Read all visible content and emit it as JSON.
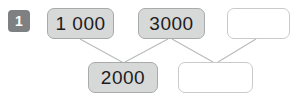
{
  "canvas": {
    "width": 296,
    "height": 98,
    "background": "#ffffff"
  },
  "exercise": {
    "number": "1"
  },
  "colors": {
    "badge_background": "#7f8082",
    "badge_text": "#ffffff",
    "filled_box_background": "#d7d8d8",
    "filled_box_border": "#a9aaaa",
    "empty_box_background": "#ffffff",
    "empty_box_border": "#c9cacb",
    "connector_line": "#b9babb",
    "text": "#1d1d1d"
  },
  "diagram": {
    "top_row": [
      {
        "id": "node-1000",
        "value": "1 000",
        "state": "filled"
      },
      {
        "id": "node-3000",
        "value": "3000",
        "state": "filled"
      },
      {
        "id": "node-blank-top",
        "value": "",
        "state": "empty"
      }
    ],
    "bottom_row": [
      {
        "id": "node-2000",
        "value": "2000",
        "state": "filled"
      },
      {
        "id": "node-blank-bottom",
        "value": "",
        "state": "empty"
      }
    ],
    "connectors": [
      {
        "from": "node-1000",
        "to": "node-2000"
      },
      {
        "from": "node-3000",
        "to": "node-2000"
      },
      {
        "from": "node-3000",
        "to": "node-blank-bottom"
      },
      {
        "from": "node-blank-top",
        "to": "node-blank-bottom"
      }
    ]
  }
}
